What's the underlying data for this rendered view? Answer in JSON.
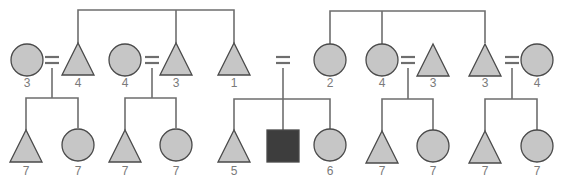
{
  "diagram": {
    "type": "pedigree",
    "colors": {
      "fill": "#c6c6c6",
      "affected_fill": "#3d3d3d",
      "stroke": "#4a4a4a",
      "line": "#6e6e6e",
      "label": "#7a7a7a"
    },
    "generation_1": [
      {
        "id": "g1-1",
        "shape": "circle",
        "x": 27,
        "label": "3"
      },
      {
        "id": "g1-2",
        "shape": "triangle",
        "x": 78,
        "label": "4"
      },
      {
        "id": "g1-3",
        "shape": "circle",
        "x": 125,
        "label": "4"
      },
      {
        "id": "g1-4",
        "shape": "triangle",
        "x": 176,
        "label": "3"
      },
      {
        "id": "g1-5",
        "shape": "triangle",
        "x": 234,
        "label": "1"
      },
      {
        "id": "g1-6",
        "shape": "circle",
        "x": 330,
        "label": "2"
      },
      {
        "id": "g1-7",
        "shape": "circle",
        "x": 382,
        "label": "4"
      },
      {
        "id": "g1-8",
        "shape": "triangle",
        "x": 433,
        "label": "3"
      },
      {
        "id": "g1-9",
        "shape": "triangle",
        "x": 485,
        "label": "3"
      },
      {
        "id": "g1-10",
        "shape": "circle",
        "x": 537,
        "label": "4"
      }
    ],
    "generation_2": [
      {
        "id": "g2-1",
        "shape": "triangle",
        "x": 26,
        "label": "7"
      },
      {
        "id": "g2-2",
        "shape": "circle",
        "x": 78,
        "label": "7"
      },
      {
        "id": "g2-3",
        "shape": "triangle",
        "x": 125,
        "label": "7"
      },
      {
        "id": "g2-4",
        "shape": "circle",
        "x": 176,
        "label": "7"
      },
      {
        "id": "g2-5",
        "shape": "triangle",
        "x": 234,
        "label": "5"
      },
      {
        "id": "g2-6",
        "shape": "square",
        "x": 283,
        "label": "",
        "affected": true
      },
      {
        "id": "g2-7",
        "shape": "circle",
        "x": 330,
        "label": "6"
      },
      {
        "id": "g2-8",
        "shape": "triangle",
        "x": 382,
        "label": "7"
      },
      {
        "id": "g2-9",
        "shape": "circle",
        "x": 433,
        "label": "7"
      },
      {
        "id": "g2-10",
        "shape": "triangle",
        "x": 485,
        "label": "7"
      },
      {
        "id": "g2-11",
        "shape": "circle",
        "x": 537,
        "label": "7"
      }
    ],
    "marriages": [
      {
        "x": 52,
        "symbol": "="
      },
      {
        "x": 152,
        "symbol": "="
      },
      {
        "x": 283,
        "symbol": "="
      },
      {
        "x": 408,
        "symbol": "="
      },
      {
        "x": 512,
        "symbol": "="
      }
    ],
    "sibships": [
      {
        "name": "left-sibship",
        "bus_y": 10,
        "from_x": 78,
        "to_x": 234,
        "drops": [
          78,
          176,
          234
        ]
      },
      {
        "name": "right-sibship",
        "bus_y": 11,
        "from_x": 330,
        "to_x": 485,
        "drops": [
          330,
          382,
          485
        ]
      }
    ]
  }
}
